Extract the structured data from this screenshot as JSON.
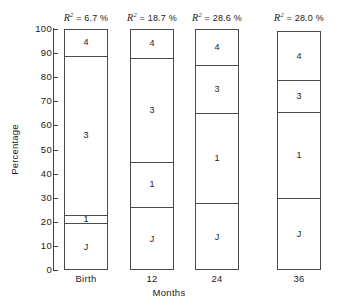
{
  "chart_data": {
    "type": "bar",
    "subtype": "stacked-percentage",
    "title": "",
    "xlabel": "Months",
    "ylabel": "Percentage",
    "ylim": [
      0,
      100
    ],
    "yticks": [
      0,
      10,
      20,
      30,
      40,
      50,
      60,
      70,
      80,
      90,
      100
    ],
    "ytick_labels": [
      "0",
      "10",
      "20",
      "30",
      "40",
      "50",
      "60",
      "70",
      "80",
      "90",
      "100"
    ],
    "grid": false,
    "legend": false,
    "categories": [
      "Birth",
      "12",
      "24",
      "36"
    ],
    "panel_annotations": [
      "R² = 6.7 %",
      "R² = 18.7 %",
      "R² = 28.6 %",
      "R² = 28.0 %"
    ],
    "r_squared_values": [
      6.7,
      18.7,
      28.6,
      28.0
    ],
    "segment_order_bottom_to_top": [
      "J",
      "1",
      "3",
      "4"
    ],
    "series": [
      {
        "name": "J",
        "label": "J",
        "values": [
          19.5,
          26.0,
          28.0,
          30.0
        ]
      },
      {
        "name": "1",
        "label": "1",
        "values": [
          3.5,
          19.0,
          37.0,
          35.5
        ]
      },
      {
        "name": "3",
        "label": "3",
        "values": [
          66.0,
          43.0,
          20.0,
          14.5
        ]
      },
      {
        "name": "4",
        "label": "4",
        "values": [
          11.0,
          12.0,
          15.0,
          20.0
        ]
      }
    ],
    "bars": [
      {
        "category": "Birth",
        "annotation": "R² = 6.7 %",
        "segments": [
          {
            "label": "4",
            "bottom": 89.0,
            "top": 100.0
          },
          {
            "label": "3",
            "bottom": 23.0,
            "top": 89.0
          },
          {
            "label": "1",
            "bottom": 19.5,
            "top": 23.0
          },
          {
            "label": "J",
            "bottom": 0.0,
            "top": 19.5
          }
        ]
      },
      {
        "category": "12",
        "annotation": "R² = 18.7 %",
        "segments": [
          {
            "label": "4",
            "bottom": 88.0,
            "top": 100.0
          },
          {
            "label": "3",
            "bottom": 45.0,
            "top": 88.0
          },
          {
            "label": "1",
            "bottom": 26.0,
            "top": 45.0
          },
          {
            "label": "J",
            "bottom": 0.0,
            "top": 26.0
          }
        ]
      },
      {
        "category": "24",
        "annotation": "R² = 28.6 %",
        "segments": [
          {
            "label": "4",
            "bottom": 85.0,
            "top": 100.0
          },
          {
            "label": "3",
            "bottom": 65.0,
            "top": 85.0
          },
          {
            "label": "1",
            "bottom": 28.0,
            "top": 65.0
          },
          {
            "label": "J",
            "bottom": 0.0,
            "top": 28.0
          }
        ]
      },
      {
        "category": "36",
        "annotation": "R² = 28.0 %",
        "segments": [
          {
            "label": "4",
            "bottom": 79.0,
            "top": 99.0
          },
          {
            "label": "3",
            "bottom": 65.5,
            "top": 79.0
          },
          {
            "label": "1",
            "bottom": 30.0,
            "top": 65.5
          },
          {
            "label": "J",
            "bottom": 0.0,
            "top": 30.0
          }
        ]
      }
    ]
  },
  "axis": {
    "y_title": "Percentage",
    "x_title": "Months"
  },
  "colors": {
    "stroke": "#4a4a4a",
    "axis": "#404040",
    "text": "#1a1a1a",
    "background": "#ffffff"
  }
}
